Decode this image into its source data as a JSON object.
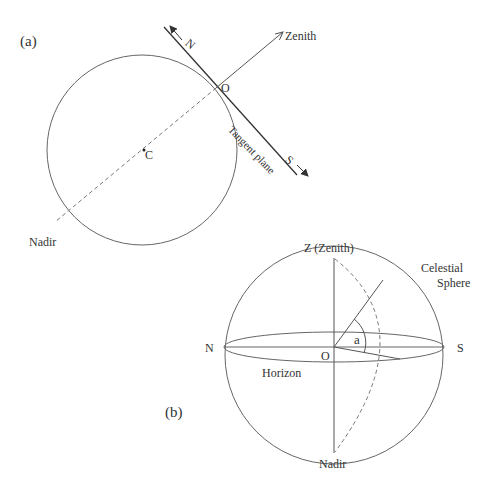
{
  "figure_a": {
    "panel_label": "(a)",
    "labels": {
      "north": "N",
      "zenith": "Zenith",
      "observer": "O",
      "tangent_plane": "Tangent plane",
      "south": "S",
      "center": "C",
      "nadir": "Nadir"
    }
  },
  "figure_b": {
    "panel_label": "(b)",
    "labels": {
      "zenith": "Z (Zenith)",
      "celestial_sphere_line1": "Celestial",
      "celestial_sphere_line2": "Sphere",
      "north": "N",
      "observer": "O",
      "angle": "a",
      "south": "S",
      "horizon": "Horizon",
      "nadir": "Nadir"
    }
  },
  "colors": {
    "line": "#555555",
    "text": "#333333",
    "background": "#ffffff"
  }
}
